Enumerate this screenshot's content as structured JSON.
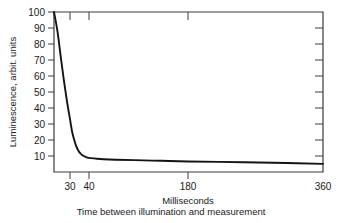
{
  "chart_data": {
    "type": "line",
    "title": "",
    "xlabel": "Time between illumination and measurement",
    "xunits": "Milliseconds",
    "ylabel": "Luminescence, arbit. units",
    "xticks": [
      30,
      40,
      180,
      360
    ],
    "xtick_labels": [
      "30",
      "40",
      "180",
      "360"
    ],
    "yticks": [
      10,
      20,
      30,
      40,
      50,
      60,
      70,
      80,
      90,
      100
    ],
    "ytick_labels": [
      "10",
      "20",
      "30",
      "40",
      "50",
      "60",
      "70",
      "80",
      "90",
      "100"
    ],
    "ylim": [
      0,
      100
    ],
    "xlim": [
      25,
      360
    ],
    "grid": false,
    "legend": false,
    "x_axis_scale": "compressed-nonlinear",
    "series": [
      {
        "name": "Luminescence decay",
        "color": "#141414",
        "x": [
          25,
          26,
          27,
          28,
          29,
          30,
          31,
          32,
          33,
          34,
          35,
          36,
          38,
          40,
          45,
          50,
          60,
          80,
          120,
          180,
          240,
          300,
          360
        ],
        "y": [
          100,
          88,
          72,
          57,
          44,
          33,
          25,
          20,
          16,
          13.5,
          11.8,
          10.6,
          9.4,
          8.8,
          8.3,
          8.0,
          7.7,
          7.4,
          7.0,
          6.6,
          6.1,
          5.6,
          5.1
        ]
      }
    ]
  },
  "axes": {
    "y_axis_title": "Luminescence, arbit. units",
    "x_axis_units_label": "Milliseconds",
    "x_axis_title": "Time between illumination and measurement"
  },
  "colors": {
    "curve": "#141414",
    "frame": "#3c3c3c",
    "text": "#1a1a1a",
    "background": "#ffffff"
  }
}
